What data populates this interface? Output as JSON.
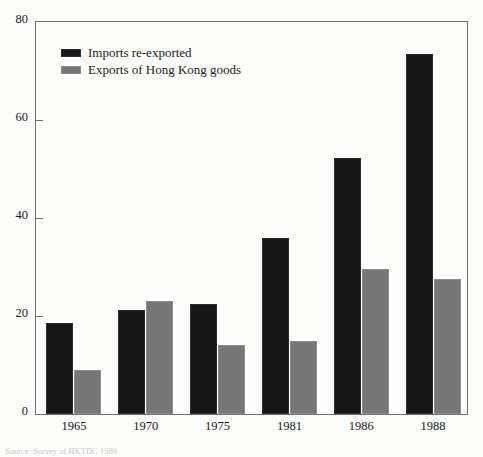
{
  "chart_data": {
    "type": "bar",
    "title": "",
    "subtitle": "",
    "xlabel": "",
    "ylabel": "",
    "categories": [
      "1965",
      "1970",
      "1975",
      "1981",
      "1986",
      "1988"
    ],
    "series": [
      {
        "name": "Imports re-exported",
        "color": "#171717",
        "values": [
          18.5,
          21.3,
          22.4,
          36.0,
          52.2,
          73.5
        ]
      },
      {
        "name": "Exports of Hong Kong goods",
        "color": "#767676",
        "values": [
          9.0,
          23.0,
          14.0,
          14.8,
          29.5,
          27.6
        ]
      }
    ],
    "ylim": [
      0,
      80
    ],
    "yticks": [
      0,
      20,
      40,
      60,
      80
    ],
    "ytick_labels": [
      "0",
      "20",
      "40",
      "60",
      "80"
    ],
    "grid": false,
    "legend_position": "upper left",
    "frame": true
  },
  "legend": {
    "entries": [
      {
        "label": "Imports re-exported"
      },
      {
        "label": "Exports of Hong Kong goods"
      }
    ]
  },
  "footer": {
    "source_note": "Source: Survey of HKTDC 1989"
  }
}
